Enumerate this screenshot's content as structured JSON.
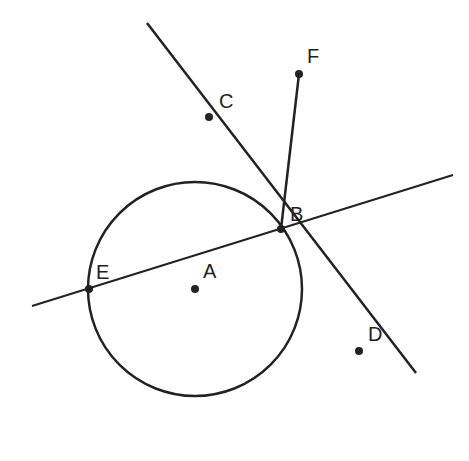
{
  "diagram": {
    "type": "geometry",
    "colors": {
      "stroke": "#222222",
      "background": "#ffffff"
    },
    "circle": {
      "center": "A",
      "cx": 195,
      "cy": 289,
      "r": 107
    },
    "points": [
      {
        "id": "A",
        "label": "A",
        "x": 195,
        "y": 289,
        "lx": 203,
        "ly": 278
      },
      {
        "id": "B",
        "label": "B",
        "x": 281,
        "y": 229,
        "lx": 290,
        "ly": 221
      },
      {
        "id": "C",
        "label": "C",
        "x": 209,
        "y": 117,
        "lx": 219,
        "ly": 108
      },
      {
        "id": "D",
        "label": "D",
        "x": 359,
        "y": 351,
        "lx": 368,
        "ly": 341
      },
      {
        "id": "E",
        "label": "E",
        "x": 89,
        "y": 289,
        "lx": 96,
        "ly": 279
      },
      {
        "id": "F",
        "label": "F",
        "x": 299,
        "y": 74,
        "lx": 307,
        "ly": 63
      }
    ],
    "lines": [
      {
        "name": "line-CD",
        "through": [
          "C",
          "D"
        ],
        "x1": 147,
        "y1": 23,
        "x2": 416,
        "y2": 373
      },
      {
        "name": "line-EB",
        "through": [
          "E",
          "B"
        ],
        "x1": 32,
        "y1": 306,
        "x2": 453,
        "y2": 175
      }
    ],
    "segments": [
      {
        "name": "segment-BF",
        "from": "B",
        "to": "F",
        "x1": 281,
        "y1": 229,
        "x2": 299,
        "y2": 74
      }
    ]
  }
}
